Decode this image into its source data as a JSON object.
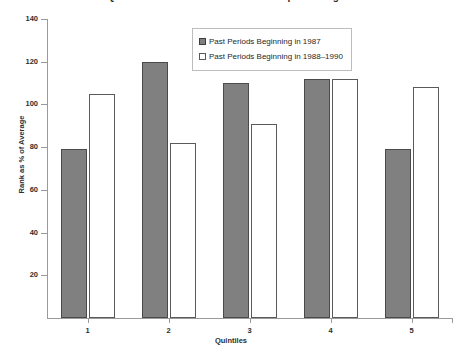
{
  "chart_data": {
    "type": "bar",
    "title": "Quintile Rank Persistence of Municipal Managers",
    "xlabel": "Quintiles",
    "ylabel": "Rank as % of Average",
    "categories": [
      "1",
      "2",
      "3",
      "4",
      "5"
    ],
    "series": [
      {
        "name": "Past Periods Beginning in 1987",
        "color": "#808080",
        "values": [
          79,
          120,
          110,
          112,
          79
        ]
      },
      {
        "name": "Past Periods Beginning in 1988–1990",
        "color": "#ffffff",
        "values": [
          105,
          82,
          91,
          112,
          108
        ]
      }
    ],
    "ylim": [
      0,
      140
    ],
    "yticks": [
      "20",
      "40",
      "60",
      "80",
      "100",
      "120",
      "140"
    ],
    "grid": false,
    "legend_position": "top-center"
  }
}
